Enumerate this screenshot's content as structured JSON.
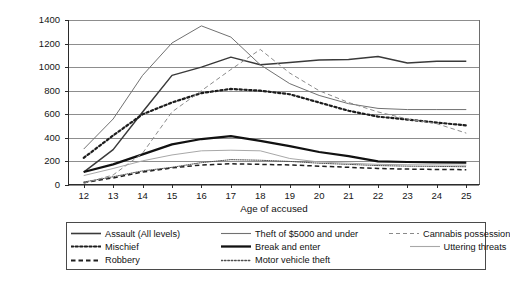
{
  "chart_data": {
    "type": "line",
    "title": "",
    "xlabel": "Age of accused",
    "ylabel": "Rate per 100,000 population",
    "x": [
      12,
      13,
      14,
      15,
      16,
      17,
      18,
      19,
      20,
      21,
      22,
      23,
      24,
      25
    ],
    "xticklabels": [
      "12",
      "13",
      "14",
      "15",
      "16",
      "17",
      "18",
      "19",
      "20",
      "21",
      "22",
      "23",
      "24",
      "25"
    ],
    "yticklabels": [
      "1400",
      "1200",
      "1000",
      "800",
      "600",
      "400",
      "200",
      "0"
    ],
    "ylim": [
      0,
      1400
    ],
    "ytick_step": 200,
    "grid": true,
    "legend_position": "bottom",
    "legend_columns": 3,
    "series": [
      {
        "name": "Assault (All levels)",
        "style": "solid",
        "width": "medium",
        "color": "#3a3a3a",
        "values": [
          110,
          300,
          620,
          930,
          1000,
          1085,
          1020,
          1040,
          1060,
          1065,
          1090,
          1035,
          1050,
          1050
        ]
      },
      {
        "name": "Mischief",
        "style": "dotted",
        "width": "thick",
        "color": "#1d1d1d",
        "values": [
          230,
          420,
          600,
          700,
          780,
          815,
          800,
          770,
          700,
          630,
          580,
          555,
          530,
          505
        ]
      },
      {
        "name": "Robbery",
        "style": "dashed",
        "width": "medium",
        "color": "#1f1f1f",
        "values": [
          20,
          60,
          110,
          145,
          170,
          180,
          175,
          170,
          160,
          150,
          140,
          135,
          132,
          130
        ]
      },
      {
        "name": "Theft of $5000 and under",
        "style": "solid",
        "width": "thin",
        "color": "#717171",
        "values": [
          305,
          560,
          930,
          1205,
          1350,
          1255,
          1020,
          860,
          760,
          690,
          650,
          640,
          640,
          640
        ]
      },
      {
        "name": "Break and enter",
        "style": "solid",
        "width": "thick",
        "color": "#111111",
        "values": [
          110,
          175,
          260,
          345,
          390,
          415,
          375,
          330,
          280,
          245,
          200,
          195,
          192,
          190
        ]
      },
      {
        "name": "Motor vehicle theft",
        "style": "dotted",
        "width": "thin",
        "color": "#4f4f4f",
        "values": [
          25,
          70,
          120,
          150,
          190,
          215,
          210,
          200,
          185,
          175,
          165,
          160,
          158,
          155
        ]
      },
      {
        "name": "Cannabis possession",
        "style": "dashed",
        "width": "thin",
        "color": "#8a8a8a",
        "values": [
          15,
          85,
          270,
          620,
          800,
          980,
          1150,
          950,
          800,
          700,
          620,
          560,
          520,
          440
        ]
      },
      {
        "name": "Uttering threats",
        "style": "solid",
        "width": "thin",
        "color": "#a8a8a8",
        "values": [
          80,
          140,
          205,
          255,
          290,
          295,
          290,
          225,
          195,
          185,
          175,
          172,
          170,
          168
        ]
      }
    ]
  },
  "legend": {
    "items": [
      {
        "label": "Assault (All levels)",
        "swatch": "line-solid-medium-dark"
      },
      {
        "label": "Theft of $5000 and under",
        "swatch": "line-solid-thin-gray"
      },
      {
        "label": "Cannabis possession",
        "swatch": "line-dashed-thin-gray"
      },
      {
        "label": "Mischief",
        "swatch": "line-dotted-thick-dark"
      },
      {
        "label": "Break and enter",
        "swatch": "line-solid-thick-black"
      },
      {
        "label": "Uttering threats",
        "swatch": "line-solid-thin-lightgray"
      },
      {
        "label": "Robbery",
        "swatch": "line-dashed-medium-dark"
      },
      {
        "label": "Motor vehicle theft",
        "swatch": "line-dotted-thin-gray"
      }
    ]
  }
}
